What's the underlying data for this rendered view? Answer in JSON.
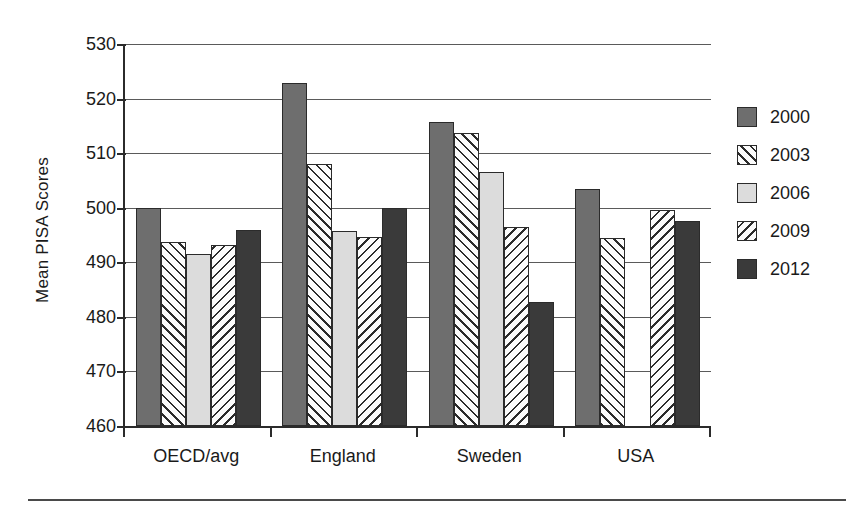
{
  "chart_data": {
    "type": "bar",
    "title": "",
    "subtitle": "",
    "xlabel": "",
    "ylabel": "Mean PISA Scores",
    "categories": [
      "OECD/avg",
      "England",
      "Sweden",
      "USA"
    ],
    "series": [
      {
        "name": "2000",
        "swatch": "solid-medium-gray",
        "color": "#6e6e6e",
        "values": [
          500.0,
          522.8,
          515.8,
          503.5
        ]
      },
      {
        "name": "2003",
        "swatch": "hatch-forward-slash",
        "color": "#fbfbfb",
        "values": [
          493.7,
          508.0,
          513.7,
          494.5
        ]
      },
      {
        "name": "2006",
        "swatch": "solid-light-gray",
        "color": "#dcdcdc",
        "values": [
          491.5,
          495.8,
          506.5,
          null
        ]
      },
      {
        "name": "2009",
        "swatch": "hatch-back-slash",
        "color": "#fbfbfb",
        "values": [
          493.2,
          494.6,
          496.5,
          499.5
        ]
      },
      {
        "name": "2012",
        "swatch": "solid-dark-gray",
        "color": "#3a3a3a",
        "values": [
          496.0,
          500.0,
          482.7,
          497.6
        ]
      }
    ],
    "ylim": [
      460,
      530
    ],
    "yticks": [
      460,
      470,
      480,
      490,
      500,
      510,
      520,
      530
    ],
    "ytick_labels": [
      "460",
      "470",
      "480",
      "490",
      "500",
      "510",
      "520",
      "530"
    ],
    "grid": true,
    "grid_axis": "y",
    "legend_position": "right",
    "legend_entries": [
      "2000",
      "2003",
      "2006",
      "2009",
      "2012"
    ],
    "annotations": []
  },
  "axis": {
    "y_title": "Mean PISA Scores"
  },
  "legend": {
    "items": [
      {
        "label": "2000"
      },
      {
        "label": "2003"
      },
      {
        "label": "2006"
      },
      {
        "label": "2009"
      },
      {
        "label": "2012"
      }
    ]
  }
}
